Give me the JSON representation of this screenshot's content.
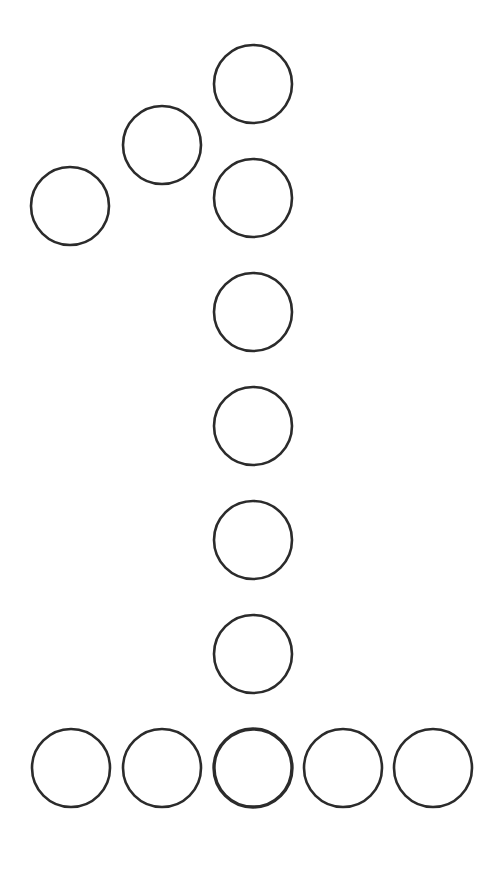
{
  "figure": {
    "width": 501,
    "height": 877,
    "background": "#ffffff",
    "stroke_color": "#2b2b2b",
    "radius": 39,
    "stroke_width": 2.6,
    "circles": [
      {
        "id": "top",
        "cx": 253,
        "cy": 84,
        "sw": 2.6
      },
      {
        "id": "flag-2",
        "cx": 162,
        "cy": 145,
        "sw": 2.6
      },
      {
        "id": "flag-1",
        "cx": 70,
        "cy": 206,
        "sw": 2.6
      },
      {
        "id": "stem-1",
        "cx": 253,
        "cy": 198,
        "sw": 2.6
      },
      {
        "id": "stem-2",
        "cx": 253,
        "cy": 312,
        "sw": 2.6
      },
      {
        "id": "stem-3",
        "cx": 253,
        "cy": 426,
        "sw": 2.6
      },
      {
        "id": "stem-4",
        "cx": 253,
        "cy": 540,
        "sw": 2.6
      },
      {
        "id": "stem-5",
        "cx": 253,
        "cy": 654,
        "sw": 2.6
      },
      {
        "id": "base-1",
        "cx": 71,
        "cy": 768,
        "sw": 2.6
      },
      {
        "id": "base-2",
        "cx": 162,
        "cy": 768,
        "sw": 2.6
      },
      {
        "id": "base-3",
        "cx": 253,
        "cy": 768,
        "sw": 3.4
      },
      {
        "id": "base-4",
        "cx": 343,
        "cy": 768,
        "sw": 2.6
      },
      {
        "id": "base-5",
        "cx": 433,
        "cy": 768,
        "sw": 2.6
      }
    ]
  }
}
